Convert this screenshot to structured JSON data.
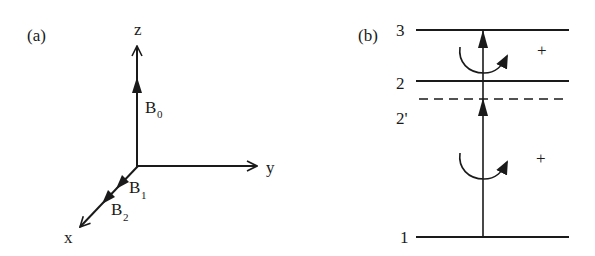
{
  "panel_a": {
    "label": "(a)",
    "axes": {
      "z": "z",
      "y": "y",
      "x": "x"
    },
    "vectors": [
      {
        "name": "B",
        "subscript": "0",
        "direction": "z"
      },
      {
        "name": "B",
        "subscript": "1",
        "direction": "x"
      },
      {
        "name": "B",
        "subscript": "2",
        "direction": "x"
      }
    ]
  },
  "panel_b": {
    "label": "(b)",
    "levels": [
      {
        "label": "3",
        "style": "solid"
      },
      {
        "label": "2",
        "style": "solid"
      },
      {
        "label": "2'",
        "style": "dashed"
      },
      {
        "label": "1",
        "style": "solid"
      }
    ],
    "transitions": [
      {
        "from": "1",
        "to": "2'",
        "polarization": "+"
      },
      {
        "from": "2'",
        "to": "3",
        "polarization": "+"
      }
    ]
  },
  "colors": {
    "ink": "#1a1a1a",
    "background": "#ffffff"
  }
}
